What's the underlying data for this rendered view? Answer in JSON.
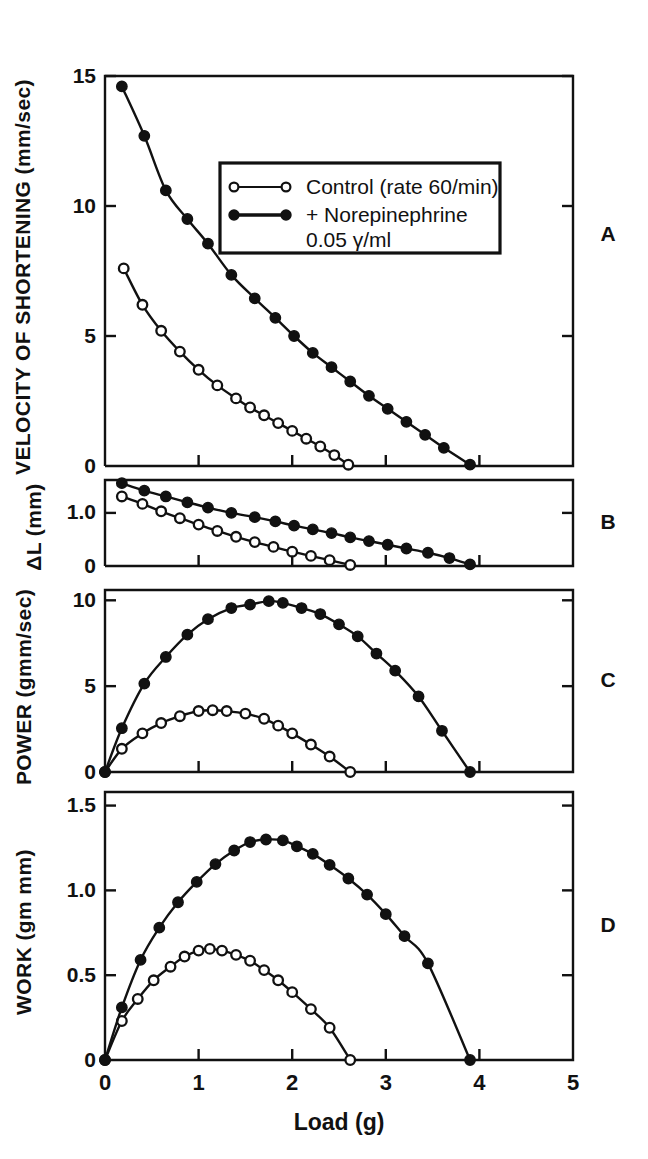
{
  "figure": {
    "xaxis_title": "Load (g)",
    "panel_letters": [
      "A",
      "B",
      "C",
      "D"
    ]
  },
  "legend": {
    "entries": [
      {
        "label": "Control (rate 60/min)",
        "marker": "open-circle"
      },
      {
        "label": "+ Norepinephrine",
        "marker": "filled-circle"
      },
      {
        "label": "0.05 γ/ml",
        "marker": "none"
      }
    ]
  },
  "chart_data": [
    {
      "type": "line",
      "panel": "A",
      "title": "",
      "xlabel": "Load (g)",
      "ylabel": "VELOCITY OF SHORTENING (mm/sec)",
      "xlim": [
        0,
        5
      ],
      "ylim": [
        0,
        15
      ],
      "xticks": [
        0,
        1,
        2,
        3,
        4,
        5
      ],
      "yticks": [
        0,
        5,
        10,
        15
      ],
      "ytick_labels": [
        "0",
        "5",
        "10",
        "15"
      ],
      "grid": false,
      "legend_position": "upper-center",
      "series": [
        {
          "name": "Control (rate 60/min)",
          "marker": "open-circle",
          "x": [
            0.2,
            0.4,
            0.6,
            0.8,
            1.0,
            1.2,
            1.4,
            1.55,
            1.7,
            1.85,
            2.0,
            2.15,
            2.3,
            2.45,
            2.6
          ],
          "y": [
            7.6,
            6.2,
            5.2,
            4.4,
            3.7,
            3.1,
            2.6,
            2.25,
            1.95,
            1.65,
            1.35,
            1.05,
            0.75,
            0.42,
            0.05
          ]
        },
        {
          "name": "+ Norepinephrine 0.05 γ/ml",
          "marker": "filled-circle",
          "x": [
            0.18,
            0.42,
            0.65,
            0.88,
            1.1,
            1.35,
            1.6,
            1.82,
            2.02,
            2.22,
            2.42,
            2.62,
            2.82,
            3.02,
            3.22,
            3.42,
            3.62,
            3.9
          ],
          "y": [
            14.6,
            12.7,
            10.6,
            9.5,
            8.55,
            7.35,
            6.45,
            5.7,
            5.0,
            4.35,
            3.8,
            3.25,
            2.7,
            2.2,
            1.7,
            1.2,
            0.7,
            0.05
          ]
        }
      ]
    },
    {
      "type": "line",
      "panel": "B",
      "title": "",
      "xlabel": "Load (g)",
      "ylabel": "ΔL (mm)",
      "xlim": [
        0,
        5
      ],
      "ylim": [
        0,
        1.62
      ],
      "xticks": [
        0,
        1,
        2,
        3,
        4,
        5
      ],
      "yticks": [
        0,
        1.0
      ],
      "ytick_labels": [
        "0",
        "1.0"
      ],
      "grid": false,
      "series": [
        {
          "name": "Control (rate 60/min)",
          "marker": "open-circle",
          "x": [
            0.18,
            0.4,
            0.6,
            0.8,
            1.0,
            1.2,
            1.4,
            1.6,
            1.8,
            2.0,
            2.2,
            2.4,
            2.62
          ],
          "y": [
            1.31,
            1.17,
            1.03,
            0.9,
            0.78,
            0.66,
            0.55,
            0.45,
            0.36,
            0.27,
            0.19,
            0.11,
            0.02
          ]
        },
        {
          "name": "+ Norepinephrine 0.05 γ/ml",
          "marker": "filled-circle",
          "x": [
            0.18,
            0.42,
            0.65,
            0.88,
            1.1,
            1.35,
            1.6,
            1.82,
            2.02,
            2.22,
            2.42,
            2.62,
            2.82,
            3.02,
            3.22,
            3.45,
            3.68,
            3.9
          ],
          "y": [
            1.56,
            1.42,
            1.31,
            1.2,
            1.1,
            1.0,
            0.92,
            0.84,
            0.76,
            0.69,
            0.62,
            0.54,
            0.47,
            0.4,
            0.33,
            0.25,
            0.15,
            0.03
          ]
        }
      ]
    },
    {
      "type": "line",
      "panel": "C",
      "title": "",
      "xlabel": "Load (g)",
      "ylabel": "POWER (gmm/sec)",
      "xlim": [
        0,
        5
      ],
      "ylim": [
        0,
        10.6
      ],
      "xticks": [
        0,
        1,
        2,
        3,
        4,
        5
      ],
      "yticks": [
        0,
        5,
        10
      ],
      "ytick_labels": [
        "0",
        "5",
        "10"
      ],
      "grid": false,
      "series": [
        {
          "name": "Control (rate 60/min)",
          "marker": "open-circle",
          "x": [
            0.0,
            0.18,
            0.4,
            0.6,
            0.8,
            1.0,
            1.15,
            1.3,
            1.5,
            1.7,
            1.85,
            2.0,
            2.2,
            2.4,
            2.62
          ],
          "y": [
            0.0,
            1.35,
            2.25,
            2.85,
            3.25,
            3.55,
            3.6,
            3.55,
            3.4,
            3.1,
            2.7,
            2.25,
            1.6,
            0.9,
            0.0
          ]
        },
        {
          "name": "+ Norepinephrine 0.05 γ/ml",
          "marker": "filled-circle",
          "x": [
            0.0,
            0.18,
            0.42,
            0.65,
            0.88,
            1.1,
            1.35,
            1.55,
            1.75,
            1.9,
            2.1,
            2.3,
            2.5,
            2.7,
            2.9,
            3.1,
            3.35,
            3.6,
            3.9
          ],
          "y": [
            0.0,
            2.55,
            5.15,
            6.7,
            8.0,
            8.9,
            9.55,
            9.75,
            9.95,
            9.85,
            9.55,
            9.2,
            8.6,
            7.9,
            6.9,
            5.9,
            4.4,
            2.4,
            0.0
          ]
        }
      ]
    },
    {
      "type": "line",
      "panel": "D",
      "title": "",
      "xlabel": "Load (g)",
      "ylabel": "WORK (gm mm)",
      "xlim": [
        0,
        5
      ],
      "ylim": [
        0,
        1.58
      ],
      "xticks": [
        0,
        1,
        2,
        3,
        4,
        5
      ],
      "yticks": [
        0,
        0.5,
        1.0,
        1.5
      ],
      "ytick_labels": [
        "0",
        "0.5",
        "1.0",
        "1.5"
      ],
      "grid": false,
      "series": [
        {
          "name": "Control (rate 60/min)",
          "marker": "open-circle",
          "x": [
            0.0,
            0.18,
            0.35,
            0.52,
            0.7,
            0.85,
            1.0,
            1.12,
            1.25,
            1.4,
            1.55,
            1.7,
            1.85,
            2.0,
            2.2,
            2.4,
            2.62
          ],
          "y": [
            0.0,
            0.23,
            0.36,
            0.47,
            0.55,
            0.61,
            0.645,
            0.655,
            0.645,
            0.62,
            0.585,
            0.53,
            0.47,
            0.4,
            0.3,
            0.19,
            0.0
          ]
        },
        {
          "name": "+ Norepinephrine 0.05 γ/ml",
          "marker": "filled-circle",
          "x": [
            0.0,
            0.18,
            0.38,
            0.58,
            0.78,
            0.98,
            1.18,
            1.38,
            1.55,
            1.72,
            1.9,
            2.05,
            2.22,
            2.4,
            2.6,
            2.8,
            3.0,
            3.2,
            3.45,
            3.9
          ],
          "y": [
            0.0,
            0.31,
            0.59,
            0.78,
            0.93,
            1.05,
            1.155,
            1.235,
            1.285,
            1.3,
            1.295,
            1.26,
            1.215,
            1.15,
            1.07,
            0.975,
            0.86,
            0.73,
            0.57,
            0.0
          ]
        }
      ]
    }
  ]
}
